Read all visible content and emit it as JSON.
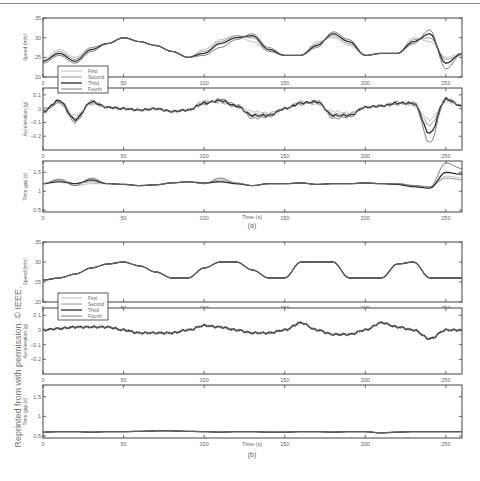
{
  "side_caption": "Reprinted from with permission. © IEEE.",
  "legend": [
    "First",
    "Second",
    "Third",
    "Fourth"
  ],
  "series_colors": [
    "#b5b5b5",
    "#8c8c8c",
    "#2e2e2e",
    "#6e6e6e"
  ],
  "xaxis": {
    "label": "Time (s)",
    "ticks": [
      0,
      50,
      100,
      150,
      200,
      250
    ],
    "range": [
      0,
      260
    ]
  },
  "panels": [
    {
      "id": "a",
      "label": "(a)"
    },
    {
      "id": "b",
      "label": "(b)"
    }
  ],
  "chart_data": [
    {
      "panel": "(a)",
      "type": "line",
      "title": "Speed",
      "xlabel": "Time (s)",
      "ylabel": "Speed (m/s)",
      "ylim": [
        20,
        35
      ],
      "yticks": [
        20,
        25,
        30,
        35
      ],
      "x": [
        0,
        10,
        20,
        30,
        40,
        50,
        60,
        70,
        80,
        90,
        100,
        110,
        120,
        130,
        140,
        150,
        160,
        170,
        180,
        190,
        200,
        210,
        220,
        230,
        240,
        250,
        260
      ],
      "series": [
        {
          "name": "First",
          "values": [
            24.5,
            27,
            25,
            27.5,
            28.5,
            30,
            29,
            28,
            26.5,
            25,
            27,
            29.5,
            30.5,
            29,
            26.5,
            25.5,
            25.5,
            29,
            30,
            28,
            25.5,
            26,
            26,
            30,
            29,
            25,
            26
          ]
        },
        {
          "name": "Second",
          "values": [
            24,
            26.5,
            24.5,
            27.5,
            28.5,
            30,
            29,
            28,
            26.5,
            25,
            26.5,
            29,
            30.5,
            30,
            26.5,
            25.5,
            25.5,
            28.5,
            30.5,
            28.5,
            25.5,
            26,
            26,
            29.5,
            30,
            24.5,
            25.5
          ]
        },
        {
          "name": "Third",
          "values": [
            24,
            26,
            24,
            27,
            28.5,
            30,
            29,
            28,
            26.5,
            25,
            26,
            28.5,
            30,
            30.5,
            27,
            25.5,
            25.5,
            28,
            31,
            29,
            25.5,
            26,
            26,
            29,
            31,
            23.5,
            26
          ]
        },
        {
          "name": "Fourth",
          "values": [
            23.5,
            25.5,
            23.5,
            26.5,
            28.5,
            30,
            29,
            28,
            26.5,
            25,
            25.5,
            27.5,
            29.5,
            31,
            27.5,
            25.5,
            25.5,
            27.5,
            31.5,
            29.5,
            25.5,
            26,
            26,
            28.5,
            32,
            22,
            26
          ]
        }
      ]
    },
    {
      "panel": "(a)",
      "type": "line",
      "title": "Acceleration",
      "xlabel": "Time (s)",
      "ylabel": "Acceleration (g)",
      "ylim": [
        -0.3,
        0.15
      ],
      "yticks": [
        -0.2,
        -0.1,
        0,
        0.1
      ],
      "x": [
        0,
        10,
        20,
        30,
        40,
        50,
        60,
        70,
        80,
        90,
        100,
        110,
        120,
        130,
        140,
        150,
        160,
        170,
        180,
        190,
        200,
        210,
        220,
        230,
        240,
        250,
        260
      ],
      "series": [
        {
          "name": "First",
          "values": [
            0,
            0.05,
            -0.05,
            0.03,
            0.01,
            0,
            -0.01,
            0,
            -0.02,
            -0.01,
            0.06,
            0.04,
            0.02,
            -0.02,
            -0.03,
            0,
            0.05,
            0.03,
            -0.02,
            -0.03,
            0.01,
            0.02,
            0.05,
            0.02,
            -0.08,
            0.05,
            0.02
          ]
        },
        {
          "name": "Second",
          "values": [
            0,
            0.04,
            -0.07,
            0.04,
            0.01,
            0,
            -0.01,
            0,
            -0.02,
            -0.01,
            0.05,
            0.05,
            0.01,
            -0.04,
            -0.04,
            0,
            0.05,
            0.04,
            -0.04,
            -0.04,
            0.01,
            0.02,
            0.05,
            0.03,
            -0.12,
            0.06,
            0.02
          ]
        },
        {
          "name": "Third",
          "values": [
            -0.02,
            0.06,
            -0.08,
            0.05,
            0.01,
            0,
            -0.01,
            0,
            -0.02,
            -0.01,
            0.04,
            0.06,
            0.02,
            -0.05,
            -0.05,
            0,
            0.04,
            0.05,
            -0.05,
            -0.05,
            0.01,
            0.02,
            0.04,
            0.04,
            -0.18,
            0.07,
            0.02
          ]
        },
        {
          "name": "Fourth",
          "values": [
            -0.03,
            0.05,
            -0.1,
            0.06,
            0.01,
            0,
            -0.01,
            0,
            -0.02,
            -0.01,
            0.03,
            0.07,
            0.03,
            -0.07,
            -0.06,
            0,
            0.03,
            0.06,
            -0.07,
            -0.06,
            0.01,
            0.02,
            0.03,
            0.05,
            -0.25,
            0.08,
            0.02
          ]
        }
      ]
    },
    {
      "panel": "(a)",
      "type": "line",
      "title": "Time gap",
      "xlabel": "Time (s)",
      "ylabel": "Time gap (s)",
      "ylim": [
        0.45,
        1.8
      ],
      "yticks": [
        0.5,
        1,
        1.5
      ],
      "x": [
        0,
        10,
        20,
        30,
        40,
        50,
        60,
        70,
        80,
        90,
        100,
        110,
        120,
        130,
        140,
        150,
        160,
        170,
        180,
        190,
        200,
        210,
        220,
        230,
        240,
        250,
        260
      ],
      "series": [
        {
          "name": "First",
          "values": [
            1.2,
            1.3,
            1.15,
            1.2,
            1.2,
            1.18,
            1.15,
            1.17,
            1.22,
            1.25,
            1.2,
            1.25,
            1.2,
            1.15,
            1.2,
            1.2,
            1.22,
            1.18,
            1.2,
            1.2,
            1.22,
            1.2,
            1.18,
            1.12,
            1.1,
            1.4,
            1.35
          ]
        },
        {
          "name": "Second",
          "values": [
            1.2,
            1.32,
            1.2,
            1.25,
            1.2,
            1.18,
            1.15,
            1.17,
            1.22,
            1.25,
            1.2,
            1.3,
            1.2,
            1.15,
            1.2,
            1.2,
            1.22,
            1.18,
            1.2,
            1.2,
            1.22,
            1.2,
            1.2,
            1.15,
            1.12,
            1.35,
            1.3
          ]
        },
        {
          "name": "Third",
          "values": [
            1.2,
            1.25,
            1.2,
            1.3,
            1.2,
            1.18,
            1.15,
            1.17,
            1.22,
            1.25,
            1.22,
            1.25,
            1.2,
            1.15,
            1.2,
            1.2,
            1.22,
            1.18,
            1.2,
            1.2,
            1.22,
            1.2,
            1.18,
            1.12,
            1.08,
            1.5,
            1.45
          ]
        },
        {
          "name": "Fourth",
          "values": [
            1.2,
            1.3,
            1.15,
            1.35,
            1.2,
            1.18,
            1.15,
            1.17,
            1.22,
            1.25,
            1.2,
            1.35,
            1.22,
            1.15,
            1.2,
            1.2,
            1.22,
            1.18,
            1.2,
            1.2,
            1.22,
            1.2,
            1.2,
            1.15,
            1.1,
            1.75,
            1.6
          ]
        }
      ]
    },
    {
      "panel": "(b)",
      "type": "line",
      "title": "Speed",
      "xlabel": "Time (s)",
      "ylabel": "Speed (m/s)",
      "ylim": [
        20,
        35
      ],
      "yticks": [
        20,
        25,
        30,
        35
      ],
      "x": [
        0,
        10,
        20,
        30,
        40,
        50,
        60,
        70,
        80,
        90,
        100,
        110,
        120,
        130,
        140,
        150,
        160,
        170,
        180,
        190,
        200,
        210,
        220,
        230,
        240,
        250,
        260
      ],
      "series": [
        {
          "name": "First",
          "values": [
            25.5,
            26,
            27,
            28.5,
            29.5,
            30,
            29,
            27.5,
            26,
            26,
            28.5,
            30,
            30,
            28,
            26,
            26,
            30,
            30,
            30,
            26,
            26,
            26,
            29.5,
            30,
            26,
            26,
            26
          ]
        },
        {
          "name": "Second",
          "values": [
            25.5,
            26,
            27,
            28.5,
            29.5,
            30,
            29,
            27.5,
            26,
            26,
            28.5,
            30,
            30,
            28,
            26,
            26,
            30,
            30,
            30,
            26,
            26,
            26,
            29.5,
            30,
            26,
            26,
            26
          ]
        },
        {
          "name": "Third",
          "values": [
            25.5,
            26,
            27,
            28.5,
            29.5,
            30,
            29,
            27.5,
            26,
            26,
            28.5,
            30,
            30,
            28,
            26,
            26,
            30,
            30,
            30,
            26,
            26,
            26,
            29.5,
            30,
            26,
            26,
            26
          ]
        },
        {
          "name": "Fourth",
          "values": [
            25.5,
            26,
            27,
            28.5,
            29.5,
            30,
            29,
            27.5,
            26,
            26,
            28.5,
            30,
            30,
            28,
            26,
            26,
            30,
            30,
            30,
            26,
            26,
            26,
            29.5,
            30,
            26,
            26,
            26
          ]
        }
      ]
    },
    {
      "panel": "(b)",
      "type": "line",
      "title": "Acceleration",
      "xlabel": "Time (s)",
      "ylabel": "Acceleration (g)",
      "ylim": [
        -0.3,
        0.15
      ],
      "yticks": [
        -0.2,
        -0.1,
        0,
        0.1
      ],
      "x": [
        0,
        10,
        20,
        30,
        40,
        50,
        60,
        70,
        80,
        90,
        100,
        110,
        120,
        130,
        140,
        150,
        160,
        170,
        180,
        190,
        200,
        210,
        220,
        230,
        240,
        250,
        260
      ],
      "series": [
        {
          "name": "First",
          "values": [
            0,
            0.01,
            0.02,
            0.02,
            0.02,
            0,
            -0.02,
            -0.02,
            -0.02,
            0,
            0.03,
            0.02,
            0,
            -0.02,
            -0.02,
            0,
            0.05,
            0,
            -0.03,
            -0.03,
            0,
            0.05,
            0.02,
            0,
            -0.06,
            0,
            0
          ]
        },
        {
          "name": "Second",
          "values": [
            0,
            0.01,
            0.02,
            0.02,
            0.02,
            0,
            -0.02,
            -0.02,
            -0.02,
            0,
            0.03,
            0.02,
            0,
            -0.02,
            -0.02,
            0,
            0.05,
            0,
            -0.03,
            -0.03,
            0,
            0.05,
            0.02,
            0,
            -0.06,
            0,
            0
          ]
        },
        {
          "name": "Third",
          "values": [
            0,
            0.01,
            0.02,
            0.02,
            0.02,
            0,
            -0.02,
            -0.02,
            -0.02,
            0,
            0.03,
            0.02,
            0,
            -0.02,
            -0.02,
            0,
            0.05,
            0,
            -0.03,
            -0.03,
            0,
            0.05,
            0.02,
            0,
            -0.06,
            0,
            0
          ]
        },
        {
          "name": "Fourth",
          "values": [
            0,
            0.01,
            0.02,
            0.02,
            0.02,
            0,
            -0.02,
            -0.02,
            -0.02,
            0,
            0.03,
            0.02,
            0,
            -0.02,
            -0.02,
            0,
            0.05,
            0,
            -0.03,
            -0.03,
            0,
            0.05,
            0.02,
            0,
            -0.06,
            0,
            0
          ]
        }
      ]
    },
    {
      "panel": "(b)",
      "type": "line",
      "title": "Time gap",
      "xlabel": "Time (s)",
      "ylabel": "Time gap (s)",
      "ylim": [
        0.45,
        1.8
      ],
      "yticks": [
        0.5,
        1,
        1.5
      ],
      "x": [
        0,
        10,
        20,
        30,
        40,
        50,
        60,
        70,
        80,
        90,
        100,
        110,
        120,
        130,
        140,
        150,
        160,
        170,
        180,
        190,
        200,
        210,
        220,
        230,
        240,
        250,
        260
      ],
      "series": [
        {
          "name": "First",
          "values": [
            0.6,
            0.61,
            0.61,
            0.6,
            0.61,
            0.61,
            0.62,
            0.63,
            0.63,
            0.62,
            0.61,
            0.6,
            0.61,
            0.61,
            0.6,
            0.6,
            0.61,
            0.61,
            0.6,
            0.61,
            0.61,
            0.58,
            0.6,
            0.61,
            0.61,
            0.61,
            0.61
          ]
        },
        {
          "name": "Second",
          "values": [
            0.6,
            0.61,
            0.61,
            0.6,
            0.61,
            0.61,
            0.62,
            0.63,
            0.63,
            0.62,
            0.61,
            0.6,
            0.61,
            0.61,
            0.6,
            0.6,
            0.61,
            0.61,
            0.6,
            0.61,
            0.61,
            0.58,
            0.6,
            0.61,
            0.61,
            0.61,
            0.61
          ]
        },
        {
          "name": "Third",
          "values": [
            0.6,
            0.61,
            0.61,
            0.6,
            0.61,
            0.61,
            0.62,
            0.63,
            0.63,
            0.62,
            0.61,
            0.6,
            0.61,
            0.61,
            0.6,
            0.6,
            0.61,
            0.61,
            0.6,
            0.61,
            0.61,
            0.58,
            0.6,
            0.61,
            0.61,
            0.61,
            0.61
          ]
        },
        {
          "name": "Fourth",
          "values": [
            0.6,
            0.61,
            0.61,
            0.6,
            0.61,
            0.61,
            0.62,
            0.63,
            0.63,
            0.62,
            0.61,
            0.6,
            0.61,
            0.61,
            0.6,
            0.6,
            0.61,
            0.61,
            0.6,
            0.61,
            0.61,
            0.58,
            0.6,
            0.61,
            0.61,
            0.61,
            0.61
          ]
        }
      ]
    }
  ]
}
